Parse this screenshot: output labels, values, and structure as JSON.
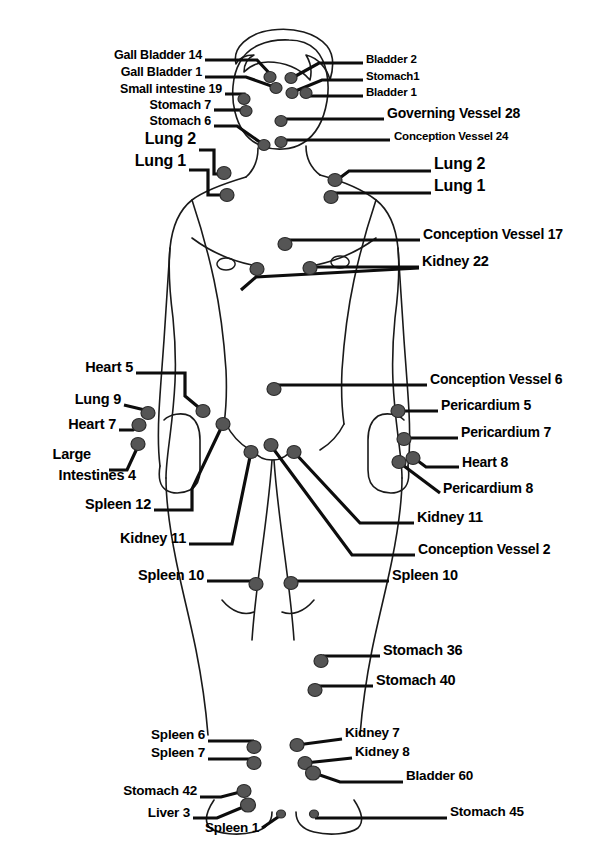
{
  "diagram": {
    "type": "anatomical-point-map",
    "view": "anterior",
    "colors": {
      "background": "#ffffff",
      "outline": "#1a1a1a",
      "point_fill": "#555555",
      "point_stroke": "#2b2b2b",
      "leader_line": "#0d0d0d",
      "label_text": "#000000"
    }
  },
  "labels": {
    "left": [
      {
        "id": "gall-bladder-14",
        "text": "Gall Bladder 14",
        "x": 202,
        "y": 58,
        "size": 12.5
      },
      {
        "id": "gall-bladder-1",
        "text": "Gall Bladder 1",
        "x": 202,
        "y": 75,
        "size": 12.5
      },
      {
        "id": "small-intestine-19",
        "text": "Small intestine 19",
        "x": 222,
        "y": 92,
        "size": 12.5
      },
      {
        "id": "stomach-7",
        "text": "Stomach 7",
        "x": 211,
        "y": 108,
        "size": 12.5
      },
      {
        "id": "stomach-6",
        "text": "Stomach 6",
        "x": 211,
        "y": 124,
        "size": 12.5
      },
      {
        "id": "lung-2-left",
        "text": "Lung 2",
        "x": 196,
        "y": 143,
        "size": 16
      },
      {
        "id": "lung-1-left",
        "text": "Lung 1",
        "x": 186,
        "y": 165,
        "size": 16
      },
      {
        "id": "heart-5",
        "text": "Heart 5",
        "x": 133,
        "y": 370,
        "size": 14.5
      },
      {
        "id": "lung-9",
        "text": "Lung 9",
        "x": 121,
        "y": 402,
        "size": 14.5
      },
      {
        "id": "heart-7",
        "text": "Heart 7",
        "x": 116,
        "y": 427,
        "size": 14.5
      },
      {
        "id": "large-intestines-4-line1",
        "text": "Large",
        "x": 91,
        "y": 457,
        "size": 14.5
      },
      {
        "id": "large-intestines-4-line2",
        "text": "Intestines 4",
        "x": 136,
        "y": 478,
        "size": 14.5
      },
      {
        "id": "spleen-12",
        "text": "Spleen 12",
        "x": 151,
        "y": 507,
        "size": 14.5
      },
      {
        "id": "kidney-11-left",
        "text": "Kidney 11",
        "x": 186,
        "y": 541,
        "size": 14.5
      },
      {
        "id": "spleen-10-left",
        "text": "Spleen 10",
        "x": 204,
        "y": 578,
        "size": 14.5
      },
      {
        "id": "spleen-6",
        "text": "Spleen 6",
        "x": 205,
        "y": 738,
        "size": 13.5
      },
      {
        "id": "spleen-7",
        "text": "Spleen 7",
        "x": 205,
        "y": 756,
        "size": 13.5
      },
      {
        "id": "stomach-42",
        "text": "Stomach 42",
        "x": 197,
        "y": 794,
        "size": 13.5
      },
      {
        "id": "liver-3",
        "text": "Liver 3",
        "x": 190,
        "y": 816,
        "size": 13.5
      },
      {
        "id": "spleen-1",
        "text": "Spleen 1",
        "x": 259,
        "y": 831,
        "size": 13.5
      }
    ],
    "right": [
      {
        "id": "bladder-2",
        "text": "Bladder 2",
        "x": 366,
        "y": 61,
        "size": 11.5
      },
      {
        "id": "stomach-1",
        "text": "Stomach1",
        "x": 366,
        "y": 78,
        "size": 11.5
      },
      {
        "id": "bladder-1",
        "text": "Bladder 1",
        "x": 366,
        "y": 94,
        "size": 11.5
      },
      {
        "id": "governing-vessel-28",
        "text": "Governing Vessel 28",
        "x": 387,
        "y": 116,
        "size": 14
      },
      {
        "id": "conception-vessel-24",
        "text": "Conception Vessel 24",
        "x": 394,
        "y": 138,
        "size": 11.5
      },
      {
        "id": "lung-2-right",
        "text": "Lung 2",
        "x": 434,
        "y": 168,
        "size": 16
      },
      {
        "id": "lung-1-right",
        "text": "Lung 1",
        "x": 434,
        "y": 190,
        "size": 16
      },
      {
        "id": "conception-vessel-17",
        "text": "Conception Vessel 17",
        "x": 423,
        "y": 237,
        "size": 14
      },
      {
        "id": "kidney-22",
        "text": "Kidney 22",
        "x": 422,
        "y": 264,
        "size": 14.5
      },
      {
        "id": "conception-vessel-6",
        "text": "Conception Vessel 6",
        "x": 430,
        "y": 382,
        "size": 14
      },
      {
        "id": "pericardium-5",
        "text": "Pericardium 5",
        "x": 441,
        "y": 408,
        "size": 14
      },
      {
        "id": "pericardium-7",
        "text": "Pericardium 7",
        "x": 461,
        "y": 435,
        "size": 14
      },
      {
        "id": "heart-8",
        "text": "Heart 8",
        "x": 462,
        "y": 465,
        "size": 14
      },
      {
        "id": "pericardium-8",
        "text": "Pericardium 8",
        "x": 443,
        "y": 491,
        "size": 14
      },
      {
        "id": "kidney-11-right",
        "text": "Kidney 11",
        "x": 417,
        "y": 520,
        "size": 14.5
      },
      {
        "id": "conception-vessel-2",
        "text": "Conception Vessel 2",
        "x": 418,
        "y": 552,
        "size": 14
      },
      {
        "id": "spleen-10-right",
        "text": "Spleen 10",
        "x": 392,
        "y": 578,
        "size": 14.5
      },
      {
        "id": "stomach-36",
        "text": "Stomach 36",
        "x": 383,
        "y": 653,
        "size": 14.5
      },
      {
        "id": "stomach-40",
        "text": "Stomach 40",
        "x": 376,
        "y": 683,
        "size": 14.5
      },
      {
        "id": "kidney-7",
        "text": "Kidney 7",
        "x": 345,
        "y": 736,
        "size": 13.5
      },
      {
        "id": "kidney-8",
        "text": "Kidney 8",
        "x": 355,
        "y": 755,
        "size": 13.5
      },
      {
        "id": "bladder-60",
        "text": "Bladder 60",
        "x": 406,
        "y": 779,
        "size": 13.5
      },
      {
        "id": "stomach-45",
        "text": "Stomach 45",
        "x": 450,
        "y": 815,
        "size": 13.5
      }
    ]
  },
  "points": [
    {
      "id": "pt-gall-bladder-14",
      "x": 270,
      "y": 77,
      "rx": 6,
      "ry": 5.5
    },
    {
      "id": "pt-gall-bladder-1",
      "x": 276,
      "y": 88,
      "rx": 6,
      "ry": 5.5
    },
    {
      "id": "pt-small-intestine-19",
      "x": 244,
      "y": 99,
      "rx": 6,
      "ry": 5.5
    },
    {
      "id": "pt-stomach-7",
      "x": 246,
      "y": 111,
      "rx": 6,
      "ry": 5.5
    },
    {
      "id": "pt-stomach-6",
      "x": 264,
      "y": 145,
      "rx": 6,
      "ry": 5.5
    },
    {
      "id": "pt-bladder-2",
      "x": 291,
      "y": 78,
      "rx": 6,
      "ry": 5.5
    },
    {
      "id": "pt-stomach-1",
      "x": 292,
      "y": 93,
      "rx": 6,
      "ry": 5.5
    },
    {
      "id": "pt-bladder-1",
      "x": 306,
      "y": 93,
      "rx": 6,
      "ry": 5.5
    },
    {
      "id": "pt-governing-vessel-28",
      "x": 281,
      "y": 121,
      "rx": 6,
      "ry": 5.5
    },
    {
      "id": "pt-conception-vessel-24",
      "x": 281,
      "y": 142,
      "rx": 6,
      "ry": 5.5
    },
    {
      "id": "pt-lung-2-left",
      "x": 224,
      "y": 173,
      "rx": 7,
      "ry": 6.5
    },
    {
      "id": "pt-lung-1-left",
      "x": 227,
      "y": 195,
      "rx": 7,
      "ry": 6.5
    },
    {
      "id": "pt-lung-2-right",
      "x": 335,
      "y": 180,
      "rx": 7,
      "ry": 6.5
    },
    {
      "id": "pt-lung-1-right",
      "x": 331,
      "y": 197,
      "rx": 7,
      "ry": 6.5
    },
    {
      "id": "pt-conception-vessel-17",
      "x": 285,
      "y": 244,
      "rx": 7,
      "ry": 6.5
    },
    {
      "id": "pt-kidney-22-left",
      "x": 257,
      "y": 269,
      "rx": 7,
      "ry": 6.5
    },
    {
      "id": "pt-kidney-22-right",
      "x": 310,
      "y": 268,
      "rx": 7,
      "ry": 6.5
    },
    {
      "id": "pt-conception-vessel-6",
      "x": 274,
      "y": 389,
      "rx": 7,
      "ry": 6.5
    },
    {
      "id": "pt-heart-5",
      "x": 203,
      "y": 411,
      "rx": 7,
      "ry": 6.5
    },
    {
      "id": "pt-lung-9",
      "x": 148,
      "y": 413,
      "rx": 7,
      "ry": 6.5
    },
    {
      "id": "pt-heart-7",
      "x": 139,
      "y": 425,
      "rx": 7,
      "ry": 6.5
    },
    {
      "id": "pt-large-intestines-4",
      "x": 138,
      "y": 444,
      "rx": 7,
      "ry": 6.5
    },
    {
      "id": "pt-pericardium-5",
      "x": 398,
      "y": 411,
      "rx": 7,
      "ry": 6.5
    },
    {
      "id": "pt-pericardium-7",
      "x": 404,
      "y": 439,
      "rx": 7,
      "ry": 6.5
    },
    {
      "id": "pt-heart-8",
      "x": 413,
      "y": 458,
      "rx": 7,
      "ry": 6.5
    },
    {
      "id": "pt-pericardium-8",
      "x": 399,
      "y": 462,
      "rx": 7,
      "ry": 6.5
    },
    {
      "id": "pt-spleen-12",
      "x": 223,
      "y": 424,
      "rx": 7,
      "ry": 6.5
    },
    {
      "id": "pt-kidney-11-left",
      "x": 251,
      "y": 452,
      "rx": 7,
      "ry": 6.5
    },
    {
      "id": "pt-conception-vessel-2",
      "x": 271,
      "y": 445,
      "rx": 7,
      "ry": 6.5
    },
    {
      "id": "pt-kidney-11-right",
      "x": 294,
      "y": 452,
      "rx": 7,
      "ry": 6.5
    },
    {
      "id": "pt-spleen-10-left",
      "x": 256,
      "y": 584,
      "rx": 7,
      "ry": 6.5
    },
    {
      "id": "pt-spleen-10-right",
      "x": 291,
      "y": 583,
      "rx": 7,
      "ry": 6.5
    },
    {
      "id": "pt-stomach-36",
      "x": 321,
      "y": 661,
      "rx": 7,
      "ry": 6.5
    },
    {
      "id": "pt-stomach-40",
      "x": 315,
      "y": 690,
      "rx": 7,
      "ry": 6.5
    },
    {
      "id": "pt-spleen-6",
      "x": 254,
      "y": 747,
      "rx": 7,
      "ry": 6.5
    },
    {
      "id": "pt-spleen-7",
      "x": 254,
      "y": 763,
      "rx": 7,
      "ry": 6.5
    },
    {
      "id": "pt-stomach-42",
      "x": 244,
      "y": 791,
      "rx": 7,
      "ry": 6.5
    },
    {
      "id": "pt-liver-3",
      "x": 248,
      "y": 805,
      "rx": 7.5,
      "ry": 7
    },
    {
      "id": "pt-spleen-1",
      "x": 281,
      "y": 814,
      "rx": 4.5,
      "ry": 4
    },
    {
      "id": "pt-kidney-7",
      "x": 297,
      "y": 745,
      "rx": 7,
      "ry": 6.5
    },
    {
      "id": "pt-kidney-8",
      "x": 305,
      "y": 763,
      "rx": 7,
      "ry": 6.5
    },
    {
      "id": "pt-bladder-60",
      "x": 313,
      "y": 773,
      "rx": 7.5,
      "ry": 7
    },
    {
      "id": "pt-stomach-45",
      "x": 314,
      "y": 814,
      "rx": 4.5,
      "ry": 4
    }
  ],
  "leaders": [
    {
      "id": "ld-gall-bladder-14",
      "d": "M205,60 L257,60 L272,76"
    },
    {
      "id": "ld-gall-bladder-1",
      "d": "M205,77 L246,77 L277,88"
    },
    {
      "id": "ld-small-intestine-19",
      "d": "M225,94 L244,94 L244,99"
    },
    {
      "id": "ld-stomach-7",
      "d": "M214,110 L245,110"
    },
    {
      "id": "ld-stomach-6",
      "d": "M214,126 L237,126 L264,145"
    },
    {
      "id": "ld-lung-2-left",
      "d": "M199,150 L214,150 L214,174 L224,174"
    },
    {
      "id": "ld-lung-1-left",
      "d": "M189,170 L208,170 L208,195 L227,195"
    },
    {
      "id": "ld-bladder-2",
      "d": "M363,63 L319,63 L292,78"
    },
    {
      "id": "ld-stomach-1",
      "d": "M363,80 L322,80 L293,92"
    },
    {
      "id": "ld-bladder-1",
      "d": "M363,96 L307,96"
    },
    {
      "id": "ld-governing-vessel-28",
      "d": "M384,119 L282,119"
    },
    {
      "id": "ld-conception-vessel-24",
      "d": "M390,140 L282,140"
    },
    {
      "id": "ld-lung-2-right",
      "d": "M431,171 L349,171 L337,180"
    },
    {
      "id": "ld-lung-1-right",
      "d": "M431,193 L332,193"
    },
    {
      "id": "ld-conception-vessel-17",
      "d": "M420,240 L287,240"
    },
    {
      "id": "ld-kidney-22",
      "d": "M419,267 L312,267"
    },
    {
      "id": "ld-kidney-22-left",
      "d": "M419,268 L256,277 L241,290"
    },
    {
      "id": "ld-conception-vessel-6",
      "d": "M427,385 L276,385"
    },
    {
      "id": "ld-pericardium-5",
      "d": "M438,411 L400,411"
    },
    {
      "id": "ld-pericardium-7",
      "d": "M458,438 L406,438"
    },
    {
      "id": "ld-heart-8",
      "d": "M459,467 L426,467 L414,458"
    },
    {
      "id": "ld-pericardium-8",
      "d": "M440,493 L400,463"
    },
    {
      "id": "ld-heart-5",
      "d": "M136,373 L185,373 L185,396 L203,411"
    },
    {
      "id": "ld-lung-9",
      "d": "M124,405 L149,411"
    },
    {
      "id": "ld-heart-7",
      "d": "M119,430 L133,430 L140,425"
    },
    {
      "id": "ld-large-intestines-4",
      "d": "M109,470 L127,470 L139,444"
    },
    {
      "id": "ld-spleen-12",
      "d": "M154,510 L192,510 L192,489 L223,424"
    },
    {
      "id": "ld-kidney-11-left",
      "d": "M189,544 L232,544 L251,452"
    },
    {
      "id": "ld-kidney-11-right",
      "d": "M414,523 L360,523 L294,452"
    },
    {
      "id": "ld-conception-vessel-2",
      "d": "M415,555 L352,555 L272,447"
    },
    {
      "id": "ld-spleen-10-left",
      "d": "M207,581 L256,581"
    },
    {
      "id": "ld-spleen-10-right",
      "d": "M389,581 L292,581"
    },
    {
      "id": "ld-stomach-36",
      "d": "M380,656 L323,656"
    },
    {
      "id": "ld-stomach-40",
      "d": "M373,686 L316,686"
    },
    {
      "id": "ld-spleen-6",
      "d": "M208,741 L254,741"
    },
    {
      "id": "ld-spleen-7",
      "d": "M208,759 L254,759"
    },
    {
      "id": "ld-stomach-42",
      "d": "M200,797 L221,797 L244,791"
    },
    {
      "id": "ld-liver-3",
      "d": "M193,818 L217,818 L248,805"
    },
    {
      "id": "ld-spleen-1",
      "d": "M262,828 L281,815"
    },
    {
      "id": "ld-kidney-7",
      "d": "M342,739 L297,745"
    },
    {
      "id": "ld-kidney-8",
      "d": "M352,758 L305,763"
    },
    {
      "id": "ld-bladder-60",
      "d": "M403,782 L340,782 L314,773"
    },
    {
      "id": "ld-stomach-45",
      "d": "M447,818 L315,818"
    }
  ],
  "body_outline": {
    "head": "M289,40 C266,39 248,47 240,62 C232,76 231,96 235,112 C239,128 248,141 262,146 C275,151 292,150 303,143 C316,135 324,119 327,101 C330,83 327,62 316,50 C309,43 299,40 289,40 Z",
    "hair": "M236,64 C232,48 248,33 272,30 C294,27 316,33 327,46 C335,56 333,70 330,80 C327,68 318,58 306,55 C311,63 312,72 310,80 C300,68 284,62 268,62 C258,62 250,66 244,72 C244,64 248,58 254,55 C246,55 239,58 236,64 Z",
    "neck_left": "M258,148 C258,160 254,170 246,177",
    "neck_right": "M306,146 C306,158 311,168 320,175",
    "torso": "M246,177 C226,183 205,190 192,200 C178,211 172,228 170,248 C168,270 170,295 173,318 C175,338 176,360 175,382 C174,402 172,420 170,436 C168,452 166,466 166,478",
    "torso_r": "M320,175 C342,181 362,189 376,200 C390,211 396,228 398,248 C400,270 398,295 395,318 C393,338 392,360 393,382 C394,402 396,420 398,436 C400,452 402,466 402,478",
    "arm_left_inner": "M192,200 C200,224 208,252 214,280 C220,308 224,340 226,370 C227,392 226,410 224,424",
    "arm_left_outer": "M170,248 C168,278 166,310 164,340 C162,368 160,392 159,412 C158,432 158,450 160,466",
    "hand_left": "M160,466 C158,478 160,486 166,490 C172,494 182,494 190,490 C196,487 200,480 200,470 L200,440 C200,428 196,420 190,416 C182,412 170,414 164,420",
    "arm_right_inner": "M376,200 C368,224 360,252 354,280 C348,308 344,340 342,370 C341,392 342,410 344,424",
    "arm_right_outer": "M398,248 C400,278 402,310 404,340 C406,368 408,392 409,412 C410,432 410,450 408,466",
    "hand_right": "M408,466 C410,478 408,486 402,490 C396,494 386,494 378,490 C372,487 368,480 368,470 L368,440 C368,428 372,420 378,416 C386,412 398,414 404,420",
    "chest_left": "M192,238 C208,250 228,260 252,265",
    "chest_right": "M376,238 C360,250 340,260 316,265",
    "nipple_left": "M226,258 a9,6 0 1,0 0.1,0 Z",
    "nipple_right": "M340,256 a9,6 0 1,0 0.1,0 Z",
    "groin_left": "M226,424 C232,436 240,444 250,450",
    "groin_right": "M344,424 C338,436 330,444 320,450",
    "crotch": "M252,448 C256,456 262,460 272,460 C282,460 288,456 292,448",
    "leg_left_outer": "M166,478 C166,500 170,530 176,560 C182,590 190,620 196,650 C202,680 206,710 208,735",
    "leg_right_outer": "M402,478 C402,500 398,530 392,560 C386,590 378,620 372,650 C366,680 362,710 360,735",
    "leg_inner_gap_left": "M272,460 C270,490 266,520 262,550 C258,580 254,610 252,640",
    "leg_inner_gap_right": "M274,460 C276,490 280,520 284,550 C288,580 292,610 294,640",
    "knee_left": "M222,600 C232,612 244,616 254,612",
    "knee_right": "M314,600 C304,612 292,616 282,612",
    "foot_left": "M214,800 C206,812 204,822 210,828 C218,834 238,836 254,832 C266,829 272,822 272,812",
    "foot_right": "M354,800 C362,812 364,822 358,828 C350,834 330,836 314,832 C302,829 296,822 296,812"
  }
}
